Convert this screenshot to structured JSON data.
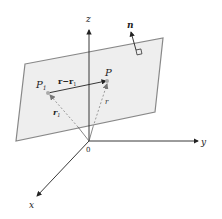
{
  "diagram": {
    "axes": {
      "z_label": "z",
      "y_label": "y",
      "x_label": "x",
      "origin_label": "0"
    },
    "points": {
      "p1_label": "P",
      "p1_sub": "1",
      "p_label": "P"
    },
    "vectors": {
      "diff_label_r": "r",
      "diff_label_minus": "−",
      "diff_label_r1": "r",
      "diff_label_r1_sub": "1",
      "r1_label": "r",
      "r1_sub": "1",
      "r_label": "r",
      "normal_label": "n"
    },
    "colors": {
      "plane_fill": "#eeeeee",
      "plane_stroke": "#888888",
      "axis": "#222222",
      "dashed": "#999999"
    }
  }
}
